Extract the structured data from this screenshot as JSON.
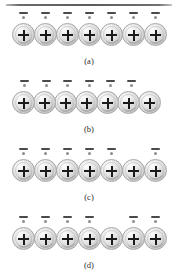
{
  "figure": {
    "top_rule": true,
    "background_color": "#ffffff",
    "ion_fill_color": "#e2e2e2",
    "ion_border_color": "#a6a6a6",
    "charge_symbol": "+",
    "electron_symbol": "-",
    "panels": [
      {
        "caption": "(a)",
        "ion_count": 7,
        "ion_positions": [
          12,
          34,
          56,
          78,
          100,
          122,
          144
        ],
        "electron_positions": [
          19,
          41,
          63,
          85,
          107,
          129,
          151
        ],
        "electron_count": 7,
        "missing_electron_index": null
      },
      {
        "caption": "(b)",
        "ion_count": 7,
        "ion_positions": [
          12,
          33,
          54,
          75,
          96,
          117,
          138
        ],
        "electron_positions": [
          20,
          42,
          63,
          85,
          106,
          127
        ],
        "electron_count": 6,
        "missing_electron_index": 6
      },
      {
        "caption": "(c)",
        "ion_count": 7,
        "ion_positions": [
          12,
          34,
          56,
          78,
          100,
          122,
          144
        ],
        "electron_positions": [
          19,
          41,
          63,
          85,
          107,
          151
        ],
        "electron_count": 6,
        "missing_electron_index": 5
      },
      {
        "caption": "(d)",
        "ion_count": 7,
        "ion_positions": [
          12,
          34,
          56,
          78,
          100,
          122,
          144
        ],
        "electron_positions": [
          19,
          41,
          63,
          85,
          129,
          151
        ],
        "electron_count": 6,
        "missing_electron_index": 4
      }
    ]
  }
}
